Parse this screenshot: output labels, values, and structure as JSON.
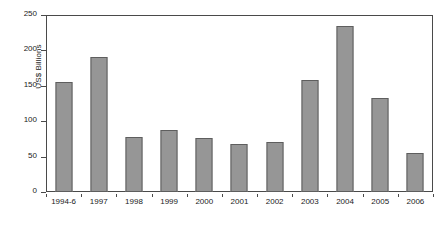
{
  "chart_data": {
    "type": "bar",
    "title": "",
    "xlabel": "",
    "ylabel": "US$ Billions",
    "categories": [
      "1994-6",
      "1997",
      "1998",
      "1999",
      "2000",
      "2001",
      "2002",
      "2003",
      "2004",
      "2005",
      "2006"
    ],
    "values": [
      155,
      191,
      77,
      87,
      76,
      68,
      70,
      158,
      234,
      133,
      55
    ],
    "series": [
      {
        "name": "US$ Billions",
        "values": [
          155,
          191,
          77,
          87,
          76,
          68,
          70,
          158,
          234,
          133,
          55
        ]
      }
    ],
    "ylim": [
      0,
      250
    ],
    "yticks": [
      0,
      50,
      100,
      150,
      200,
      250
    ],
    "ytick_labels": [
      "0",
      "50",
      "100",
      "150",
      "200",
      "250"
    ],
    "grid": false,
    "legend": null,
    "bar_color": "#969696",
    "bar_border_color": "#5e5e5e",
    "axis_color": "#4a4a4a",
    "background": "#ffffff"
  }
}
